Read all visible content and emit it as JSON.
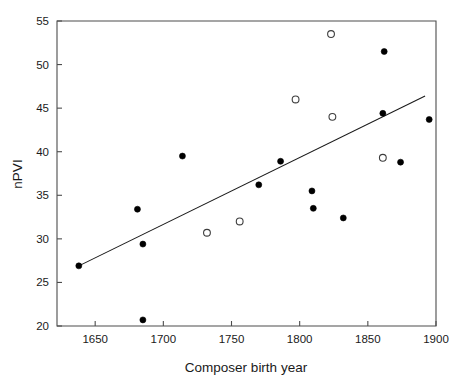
{
  "chart_data": {
    "type": "scatter",
    "title": "",
    "xlabel": "Composer birth year",
    "ylabel": "nPVI",
    "xlim": [
      1622,
      1900
    ],
    "ylim": [
      20,
      55
    ],
    "xticks": [
      1650,
      1700,
      1750,
      1800,
      1850,
      1900
    ],
    "xtick_labels": [
      "1650",
      "1700",
      "1750",
      "1800",
      "1850",
      "1900"
    ],
    "yticks": [
      20,
      25,
      30,
      35,
      40,
      45,
      50,
      55
    ],
    "ytick_labels": [
      "20",
      "25",
      "30",
      "35",
      "40",
      "45",
      "50",
      "55"
    ],
    "grid": false,
    "legend": null,
    "legend_position": "none",
    "series": [
      {
        "name": "filled-markers",
        "marker": "filled-circle",
        "color": "#000000",
        "points": [
          {
            "x": 1638,
            "y": 26.9
          },
          {
            "x": 1681,
            "y": 33.4
          },
          {
            "x": 1685,
            "y": 29.4
          },
          {
            "x": 1685,
            "y": 20.7
          },
          {
            "x": 1714,
            "y": 39.5
          },
          {
            "x": 1770,
            "y": 36.2
          },
          {
            "x": 1786,
            "y": 38.9
          },
          {
            "x": 1809,
            "y": 35.5
          },
          {
            "x": 1810,
            "y": 33.5
          },
          {
            "x": 1832,
            "y": 32.4
          },
          {
            "x": 1861,
            "y": 44.4
          },
          {
            "x": 1862,
            "y": 51.5
          },
          {
            "x": 1874,
            "y": 38.8
          },
          {
            "x": 1895,
            "y": 43.7
          }
        ]
      },
      {
        "name": "open-markers",
        "marker": "open-circle",
        "color": "#3d3d3d",
        "points": [
          {
            "x": 1732,
            "y": 30.7
          },
          {
            "x": 1756,
            "y": 32.0
          },
          {
            "x": 1797,
            "y": 46.0
          },
          {
            "x": 1823,
            "y": 53.5
          },
          {
            "x": 1824,
            "y": 44.0
          },
          {
            "x": 1861,
            "y": 39.3
          }
        ]
      }
    ],
    "trendline": {
      "name": "least-squares-fit",
      "x_start": 1638,
      "y_start": 26.9,
      "x_end": 1892,
      "y_end": 46.4
    }
  }
}
